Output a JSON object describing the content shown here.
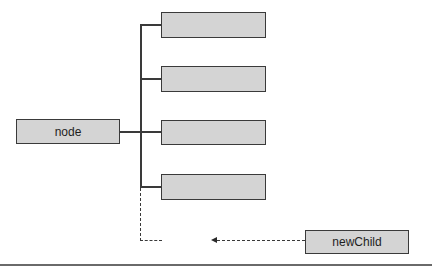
{
  "diagram": {
    "type": "tree-insertion",
    "parent": {
      "label": "node"
    },
    "children": [
      {
        "label": ""
      },
      {
        "label": ""
      },
      {
        "label": ""
      },
      {
        "label": ""
      }
    ],
    "new_child": {
      "label": "newChild"
    },
    "colors": {
      "box_fill": "#d4d4d4",
      "box_border": "#3a3a3a",
      "line": "#3a3a3a",
      "rule": "#6a6a6a"
    }
  }
}
